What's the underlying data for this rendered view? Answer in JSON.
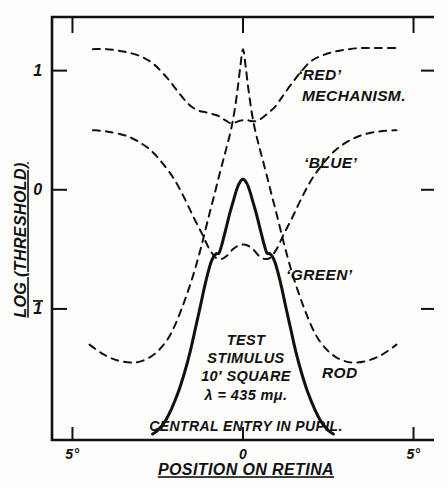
{
  "figure": {
    "background_color": "#fdfdfc",
    "ink_color": "#111111"
  },
  "axis_titles": {
    "y": "LOG (THRESHOLD)",
    "x": "POSITION ON RETINA"
  },
  "y_ticks": [
    {
      "label": "1",
      "value": 1,
      "overbar": false
    },
    {
      "label": "0",
      "value": 0,
      "overbar": false
    },
    {
      "label": "1",
      "value": -1,
      "overbar": true
    }
  ],
  "x_ticks": [
    {
      "label": "5°",
      "value": -5
    },
    {
      "label": "0",
      "value": 0
    },
    {
      "label": "5°",
      "value": 5
    }
  ],
  "annotations": {
    "red": "‘RED’",
    "red_second_line": "MECHANISM.",
    "blue": "‘BLUE’",
    "green": "‘GREEN’",
    "rod": "ROD",
    "central_entry": "CENTRAL ENTRY IN PUPIL.",
    "stimulus_line1": "TEST",
    "stimulus_line2": "STIMULUS",
    "stimulus_line3": "10′ SQUARE",
    "stimulus_line4": "λ = 435 mμ."
  },
  "chart_data": {
    "type": "line",
    "title": "",
    "subtitle": "",
    "xlabel": "POSITION ON RETINA",
    "ylabel": "LOG (THRESHOLD)",
    "xlim": [
      -5.6,
      5.6
    ],
    "ylim": [
      -2.1,
      1.45
    ],
    "grid": false,
    "legend": "inline-annotations",
    "x_tick_values": [
      -5,
      0,
      5
    ],
    "x_tick_labels": [
      "5°",
      "0",
      "5°"
    ],
    "y_tick_values": [
      1,
      0,
      -1
    ],
    "y_tick_labels": [
      "1",
      "0",
      "̄1"
    ],
    "series": [
      {
        "name": "'RED' mechanism",
        "style": "dashed",
        "x": [
          -4.4,
          -4.0,
          -3.5,
          -3.0,
          -2.6,
          -2.2,
          -1.9,
          -1.6,
          -1.35,
          -1.1,
          -0.95,
          -0.82,
          -0.72,
          -0.62,
          -0.5,
          -0.38,
          -0.28,
          -0.18,
          -0.08,
          0.0,
          0.1,
          0.2,
          0.3,
          0.42,
          0.55,
          0.68,
          0.8,
          0.95,
          1.15,
          1.4,
          1.7,
          2.0,
          2.35,
          2.7,
          3.1,
          3.5,
          4.0,
          4.5
        ],
        "y": [
          1.18,
          1.18,
          1.16,
          1.12,
          1.05,
          0.93,
          0.82,
          0.72,
          0.67,
          0.65,
          0.64,
          0.63,
          0.62,
          0.6,
          0.58,
          0.56,
          0.56,
          0.57,
          0.58,
          0.585,
          0.585,
          0.58,
          0.575,
          0.58,
          0.6,
          0.63,
          0.66,
          0.7,
          0.78,
          0.88,
          0.99,
          1.08,
          1.13,
          1.16,
          1.18,
          1.19,
          1.19,
          1.19
        ]
      },
      {
        "name": "'BLUE' mechanism",
        "style": "dashed",
        "x": [
          -4.4,
          -4.0,
          -3.5,
          -3.1,
          -2.7,
          -2.35,
          -2.0,
          -1.7,
          -1.45,
          -1.2,
          -1.0,
          -0.8,
          -0.62,
          -0.45,
          -0.3,
          -0.15,
          0.0,
          0.15,
          0.3,
          0.45,
          0.62,
          0.8,
          1.0,
          1.2,
          1.45,
          1.7,
          2.0,
          2.35,
          2.7,
          3.1,
          3.5,
          4.0,
          4.5
        ],
        "y": [
          0.5,
          0.49,
          0.46,
          0.41,
          0.33,
          0.22,
          0.08,
          -0.08,
          -0.23,
          -0.37,
          -0.49,
          -0.57,
          -0.58,
          -0.55,
          -0.5,
          -0.47,
          -0.46,
          -0.47,
          -0.5,
          -0.55,
          -0.58,
          -0.57,
          -0.49,
          -0.37,
          -0.23,
          -0.08,
          0.08,
          0.22,
          0.33,
          0.41,
          0.46,
          0.49,
          0.5
        ]
      },
      {
        "name": "'GREEN' mechanism",
        "style": "dashed",
        "x": [
          -4.5,
          -4.1,
          -3.7,
          -3.3,
          -3.0,
          -2.7,
          -2.45,
          -2.2,
          -2.0,
          -1.8,
          -1.6,
          -1.4,
          -1.2,
          -1.0,
          -0.82,
          -0.68,
          -0.55,
          -0.44,
          -0.34,
          -0.25,
          -0.16,
          -0.08,
          0.0,
          0.08,
          0.16,
          0.25,
          0.34,
          0.44,
          0.55,
          0.68,
          0.82,
          1.0,
          1.2,
          1.4,
          1.6,
          1.8,
          2.0,
          2.2,
          2.45,
          2.7,
          3.0,
          3.3,
          3.7,
          4.1,
          4.5
        ],
        "y": [
          -1.3,
          -1.38,
          -1.43,
          -1.45,
          -1.44,
          -1.4,
          -1.34,
          -1.25,
          -1.14,
          -1.0,
          -0.84,
          -0.66,
          -0.45,
          -0.22,
          -0.02,
          0.14,
          0.28,
          0.4,
          0.52,
          0.66,
          0.84,
          1.03,
          1.18,
          1.03,
          0.84,
          0.66,
          0.52,
          0.4,
          0.28,
          0.14,
          -0.02,
          -0.22,
          -0.45,
          -0.66,
          -0.84,
          -1.0,
          -1.14,
          -1.25,
          -1.34,
          -1.4,
          -1.44,
          -1.45,
          -1.43,
          -1.38,
          -1.3
        ]
      },
      {
        "name": "Rod mechanism",
        "style": "solid",
        "x": [
          -2.65,
          -2.5,
          -2.3,
          -2.1,
          -1.9,
          -1.72,
          -1.55,
          -1.4,
          -1.26,
          -1.14,
          -1.03,
          -0.94,
          -0.86,
          -0.8,
          -0.76,
          -0.73,
          -0.7,
          -0.66,
          -0.6,
          -0.53,
          -0.46,
          -0.4,
          -0.33,
          -0.27,
          -0.21,
          -0.15,
          -0.1,
          -0.05,
          0.0,
          0.05,
          0.1,
          0.15,
          0.21,
          0.27,
          0.33,
          0.4,
          0.46,
          0.53,
          0.6,
          0.66,
          0.7,
          0.73,
          0.76,
          0.8,
          0.86,
          0.94,
          1.03,
          1.14,
          1.26,
          1.4,
          1.55,
          1.72,
          1.9,
          2.1,
          2.3,
          2.5,
          2.65
        ],
        "y": [
          -2.05,
          -2.02,
          -1.95,
          -1.84,
          -1.7,
          -1.54,
          -1.36,
          -1.17,
          -0.99,
          -0.83,
          -0.7,
          -0.61,
          -0.56,
          -0.54,
          -0.535,
          -0.535,
          -0.53,
          -0.5,
          -0.44,
          -0.36,
          -0.28,
          -0.21,
          -0.14,
          -0.08,
          -0.02,
          0.03,
          0.06,
          0.08,
          0.09,
          0.08,
          0.06,
          0.03,
          -0.02,
          -0.08,
          -0.14,
          -0.21,
          -0.28,
          -0.36,
          -0.44,
          -0.5,
          -0.53,
          -0.535,
          -0.535,
          -0.54,
          -0.56,
          -0.61,
          -0.7,
          -0.83,
          -0.99,
          -1.17,
          -1.36,
          -1.54,
          -1.7,
          -1.84,
          -1.95,
          -2.02,
          -2.05
        ]
      }
    ]
  }
}
